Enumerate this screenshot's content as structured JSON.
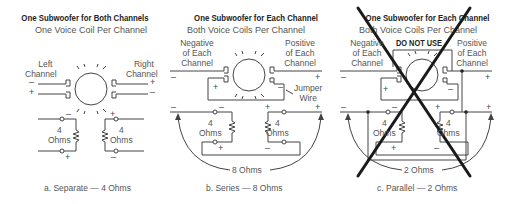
{
  "panels": [
    {
      "title": "One Subwoofer for Both Channels",
      "subtitle": "One Voice Coil Per Channel",
      "left_label": [
        "Left",
        "Channel"
      ],
      "right_label": [
        "Right",
        "Channel"
      ],
      "coil_left": {
        "ohms_value": "4",
        "ohms_unit": "Ohms"
      },
      "coil_right": {
        "ohms_value": "4",
        "ohms_unit": "Ohms"
      },
      "caption": "a. Separate — 4 Ohms"
    },
    {
      "title": "One Subwoofer for Each Channel",
      "subtitle": "Both Voice Coils Per Channel",
      "left_label": [
        "Negative",
        "of Each",
        "Channel"
      ],
      "right_label": [
        "Positive",
        "of Each",
        "Channel"
      ],
      "jumper_label": [
        "Jumper",
        "Wire"
      ],
      "coil_left": {
        "ohms_value": "4",
        "ohms_unit": "Ohms"
      },
      "coil_right": {
        "ohms_value": "4",
        "ohms_unit": "Ohms"
      },
      "total": "8 Ohms",
      "caption": "b. Series — 8 Ohms"
    },
    {
      "title": "One Subwoofer for Each Channel",
      "subtitle": "Both Voice Coils Per Channel",
      "warning": "DO NOT USE",
      "left_label": [
        "Negative",
        "of Each",
        "Channel"
      ],
      "right_label": [
        "Positive",
        "of Each",
        "Channel"
      ],
      "coil_left": {
        "ohms_value": "4",
        "ohms_unit": "Ohms"
      },
      "coil_right": {
        "ohms_value": "4",
        "ohms_unit": "Ohms"
      },
      "total": "2 Ohms",
      "caption": "c. Parallel — 2 Ohms"
    }
  ],
  "signs": {
    "plus": "+",
    "minus": "–"
  }
}
